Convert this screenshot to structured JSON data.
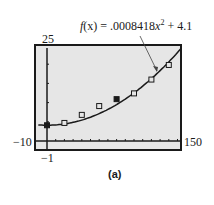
{
  "chart_data": {
    "type": "scatter",
    "title": "",
    "equation_label": "f(x) = .0008418x^2 + 4.1",
    "model": {
      "a": 0.0008418,
      "b": 0,
      "c": 4.1,
      "form": "quadratic"
    },
    "xlim": [
      -10,
      150
    ],
    "ylim": [
      -1,
      25
    ],
    "window_labels": {
      "xmin": "-10",
      "xmax": "150",
      "ymin": "-1",
      "ymax": "25"
    },
    "grid": false,
    "series": [
      {
        "name": "data",
        "marker": "open-square",
        "x": [
          0,
          20,
          40,
          60,
          80,
          100,
          120,
          140
        ],
        "y": [
          4.1,
          4.7,
          6.8,
          9.1,
          10.9,
          12.4,
          16.0,
          19.8
        ]
      },
      {
        "name": "f(x)",
        "type": "line"
      }
    ],
    "caption": "(a)"
  },
  "labels": {
    "eq_f": "f",
    "eq_x": "(x) = .0008418",
    "eq_var": "x",
    "eq_exp": "2",
    "eq_rest": " + 4.1",
    "ymax": "25",
    "ymin": "−1",
    "xmin": "−10",
    "xmax": "150",
    "caption": "(a)"
  }
}
